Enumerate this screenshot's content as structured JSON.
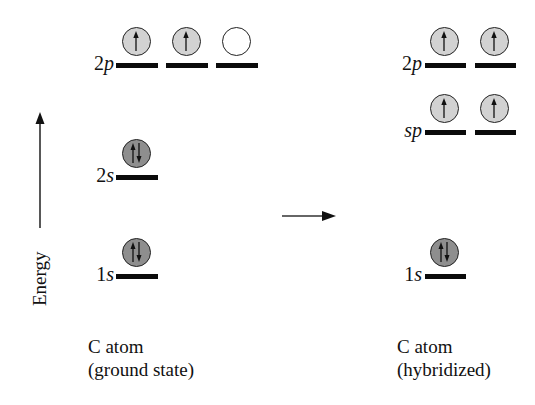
{
  "diagram": {
    "type": "orbital-energy-diagram",
    "axis": {
      "label": "Energy",
      "direction": "up"
    },
    "transition_arrow": "right",
    "colors": {
      "half_filled": "#d2d2d2",
      "full_filled": "#8e8e8e",
      "empty": "#ffffff",
      "line": "#0b0b0b"
    },
    "ground_state": {
      "caption_line1": "C atom",
      "caption_line2": "(ground state)",
      "levels": [
        {
          "num": "2",
          "sub": "p",
          "orbitals": [
            "up",
            "up",
            "empty"
          ]
        },
        {
          "num": "2",
          "sub": "s",
          "orbitals": [
            "pair"
          ]
        },
        {
          "num": "1",
          "sub": "s",
          "orbitals": [
            "pair"
          ]
        }
      ]
    },
    "hybridized": {
      "caption_line1": "C atom",
      "caption_line2": "(hybridized)",
      "levels": [
        {
          "num": "2",
          "sub": "p",
          "orbitals": [
            "up",
            "up"
          ]
        },
        {
          "num": "",
          "sub": "sp",
          "orbitals": [
            "up",
            "up"
          ]
        },
        {
          "num": "1",
          "sub": "s",
          "orbitals": [
            "pair"
          ]
        }
      ]
    }
  }
}
